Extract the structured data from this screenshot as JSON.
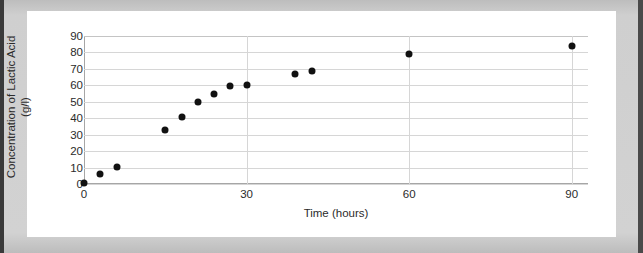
{
  "chart_data": {
    "type": "scatter",
    "title": "",
    "xlabel": "Time (hours)",
    "ylabel": "Concentration of Lactic Acid (g/l)",
    "ylabel_line1": "Concentration of Lactic Acid",
    "ylabel_line2": "(g/l)",
    "xlim": [
      0,
      93
    ],
    "ylim": [
      0,
      90
    ],
    "xticks": [
      0,
      30,
      60,
      90
    ],
    "xtick_labels": [
      "0",
      "30",
      "60",
      "90"
    ],
    "yticks": [
      0,
      10,
      20,
      30,
      40,
      50,
      60,
      70,
      80,
      90
    ],
    "ytick_labels": [
      "0",
      "10",
      "20",
      "30",
      "40",
      "50",
      "60",
      "70",
      "80",
      "90"
    ],
    "grid": "horizontal-and-major-vertical",
    "legend": "none",
    "marker_color": "#111111",
    "gridline_color": "#d6d6d6",
    "axis_color": "#a6a6a6",
    "points": [
      {
        "x": 0,
        "y": 0.5
      },
      {
        "x": 3,
        "y": 6
      },
      {
        "x": 6,
        "y": 10.5
      },
      {
        "x": 15,
        "y": 33
      },
      {
        "x": 18,
        "y": 40.5
      },
      {
        "x": 21,
        "y": 50
      },
      {
        "x": 24,
        "y": 55
      },
      {
        "x": 27,
        "y": 59.5
      },
      {
        "x": 30,
        "y": 60.5
      },
      {
        "x": 39,
        "y": 67
      },
      {
        "x": 42,
        "y": 68.5
      },
      {
        "x": 60,
        "y": 79
      },
      {
        "x": 90,
        "y": 84
      }
    ]
  },
  "page": {
    "background_color": "#c9c9c9",
    "card_color": "#ffffff"
  }
}
